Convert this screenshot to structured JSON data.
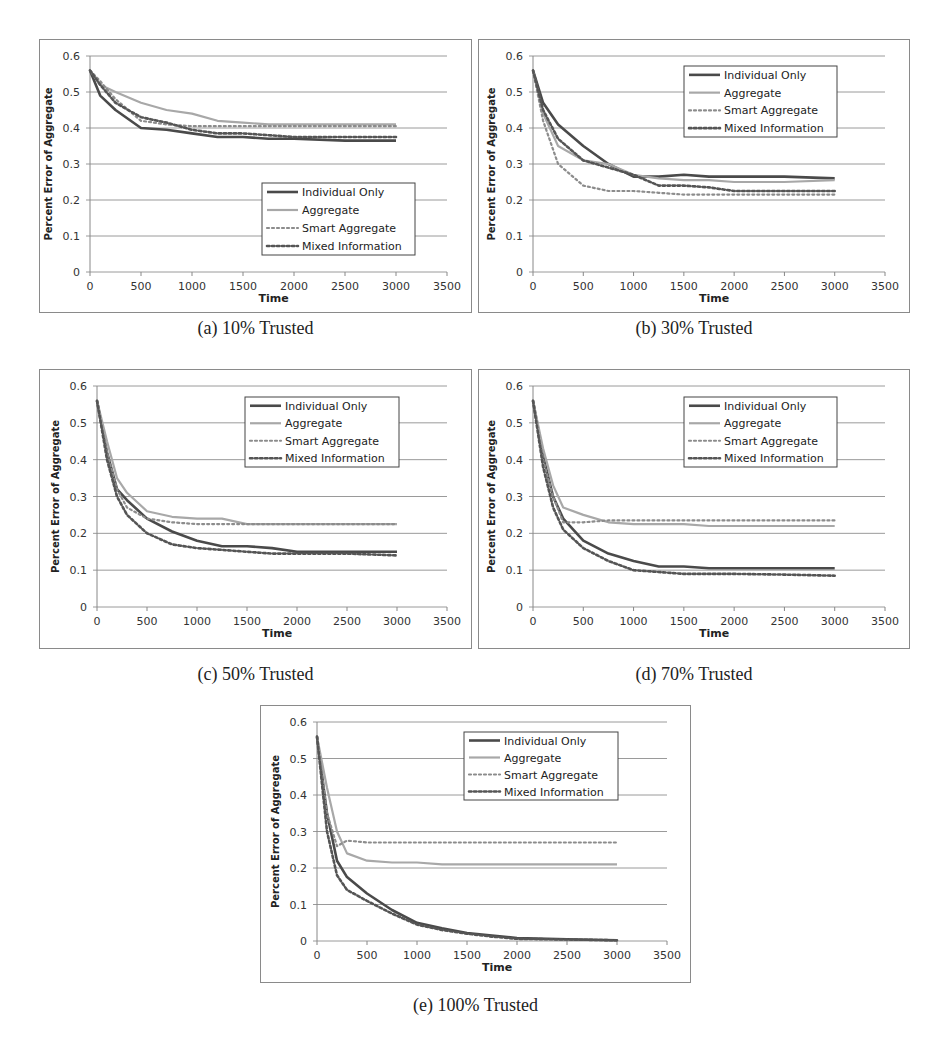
{
  "figure": {
    "captions": [
      "(a) 10% Trusted",
      "(b) 30% Trusted",
      "(c) 50% Trusted",
      "(d) 70% Trusted",
      "(e) 100% Trusted"
    ]
  },
  "colors": {
    "individual_only": "#4a4a4a",
    "aggregate": "#a8a8a8",
    "smart_aggregate": "#8c8c8c",
    "mixed_information": "#555555",
    "gridline": "#9a9a9a",
    "frame": "#8a8a8a"
  },
  "chart_data": [
    {
      "type": "line",
      "title": "(a) 10% Trusted",
      "xlabel": "Time",
      "ylabel": "Percent Error of Aggregate",
      "xlim": [
        0,
        3500
      ],
      "ylim": [
        0,
        0.6
      ],
      "xticks": [
        "0",
        "500",
        "1000",
        "1500",
        "2000",
        "2500",
        "3000",
        "3500"
      ],
      "yticks": [
        "0",
        "0.1",
        "0.2",
        "0.3",
        "0.4",
        "0.5",
        "0.6"
      ],
      "grid": "horizontal",
      "legend": {
        "position": "lower-right",
        "entries": [
          "Individual Only",
          "Aggregate",
          "Smart Aggregate",
          "Mixed Information"
        ]
      },
      "x": [
        0,
        100,
        250,
        500,
        750,
        1000,
        1250,
        1500,
        1750,
        2000,
        2500,
        3000
      ],
      "series": [
        {
          "name": "Individual Only",
          "style": "solid-dark",
          "values": [
            0.56,
            0.49,
            0.45,
            0.4,
            0.395,
            0.385,
            0.375,
            0.375,
            0.37,
            0.37,
            0.365,
            0.365
          ]
        },
        {
          "name": "Aggregate",
          "style": "solid-light",
          "values": [
            0.56,
            0.52,
            0.5,
            0.47,
            0.45,
            0.44,
            0.42,
            0.415,
            0.41,
            0.41,
            0.41,
            0.41
          ]
        },
        {
          "name": "Smart Aggregate",
          "style": "dotted-light",
          "values": [
            0.56,
            0.53,
            0.48,
            0.42,
            0.41,
            0.405,
            0.405,
            0.405,
            0.405,
            0.405,
            0.405,
            0.405
          ]
        },
        {
          "name": "Mixed Information",
          "style": "dotted-dark",
          "values": [
            0.56,
            0.52,
            0.47,
            0.43,
            0.415,
            0.395,
            0.385,
            0.385,
            0.38,
            0.375,
            0.375,
            0.375
          ]
        }
      ]
    },
    {
      "type": "line",
      "title": "(b) 30% Trusted",
      "xlabel": "Time",
      "ylabel": "Percent Error of Aggregate",
      "xlim": [
        0,
        3500
      ],
      "ylim": [
        0,
        0.6
      ],
      "xticks": [
        "0",
        "500",
        "1000",
        "1500",
        "2000",
        "2500",
        "3000",
        "3500"
      ],
      "yticks": [
        "0",
        "0.1",
        "0.2",
        "0.3",
        "0.4",
        "0.5",
        "0.6"
      ],
      "grid": "horizontal",
      "legend": {
        "position": "upper-right",
        "entries": [
          "Individual Only",
          "Aggregate",
          "Smart Aggregate",
          "Mixed Information"
        ]
      },
      "x": [
        0,
        100,
        250,
        500,
        750,
        1000,
        1250,
        1500,
        1750,
        2000,
        2500,
        3000
      ],
      "series": [
        {
          "name": "Individual Only",
          "style": "solid-dark",
          "values": [
            0.56,
            0.47,
            0.41,
            0.35,
            0.3,
            0.265,
            0.265,
            0.27,
            0.265,
            0.265,
            0.265,
            0.26
          ]
        },
        {
          "name": "Aggregate",
          "style": "solid-light",
          "values": [
            0.56,
            0.44,
            0.35,
            0.31,
            0.3,
            0.27,
            0.26,
            0.255,
            0.255,
            0.25,
            0.25,
            0.255
          ]
        },
        {
          "name": "Smart Aggregate",
          "style": "dotted-light",
          "values": [
            0.56,
            0.42,
            0.3,
            0.24,
            0.225,
            0.225,
            0.22,
            0.215,
            0.215,
            0.215,
            0.215,
            0.215
          ]
        },
        {
          "name": "Mixed Information",
          "style": "dotted-dark",
          "values": [
            0.56,
            0.45,
            0.37,
            0.31,
            0.29,
            0.27,
            0.24,
            0.24,
            0.235,
            0.225,
            0.225,
            0.225
          ]
        }
      ]
    },
    {
      "type": "line",
      "title": "(c) 50% Trusted",
      "xlabel": "Time",
      "ylabel": "Percent Error of Aggregate",
      "xlim": [
        0,
        3500
      ],
      "ylim": [
        0,
        0.6
      ],
      "xticks": [
        "0",
        "500",
        "1000",
        "1500",
        "2000",
        "2500",
        "3000",
        "3500"
      ],
      "yticks": [
        "0",
        "0.1",
        "0.2",
        "0.3",
        "0.4",
        "0.5",
        "0.6"
      ],
      "grid": "horizontal",
      "legend": {
        "position": "upper-right",
        "entries": [
          "Individual Only",
          "Aggregate",
          "Smart Aggregate",
          "Mixed Information"
        ]
      },
      "x": [
        0,
        100,
        200,
        300,
        500,
        750,
        1000,
        1250,
        1500,
        1750,
        2000,
        2500,
        3000
      ],
      "series": [
        {
          "name": "Individual Only",
          "style": "solid-dark",
          "values": [
            0.56,
            0.42,
            0.32,
            0.29,
            0.24,
            0.205,
            0.18,
            0.165,
            0.165,
            0.16,
            0.15,
            0.15,
            0.15
          ]
        },
        {
          "name": "Aggregate",
          "style": "solid-light",
          "values": [
            0.56,
            0.45,
            0.35,
            0.31,
            0.26,
            0.245,
            0.24,
            0.24,
            0.225,
            0.225,
            0.225,
            0.225,
            0.225
          ]
        },
        {
          "name": "Smart Aggregate",
          "style": "dotted-light",
          "values": [
            0.56,
            0.42,
            0.32,
            0.27,
            0.24,
            0.23,
            0.225,
            0.225,
            0.225,
            0.225,
            0.225,
            0.225,
            0.225
          ]
        },
        {
          "name": "Mixed Information",
          "style": "dotted-dark",
          "values": [
            0.56,
            0.4,
            0.3,
            0.25,
            0.2,
            0.17,
            0.16,
            0.155,
            0.15,
            0.145,
            0.145,
            0.145,
            0.14
          ]
        }
      ]
    },
    {
      "type": "line",
      "title": "(d) 70% Trusted",
      "xlabel": "Time",
      "ylabel": "Percent Error of Aggregate",
      "xlim": [
        0,
        3500
      ],
      "ylim": [
        0,
        0.6
      ],
      "xticks": [
        "0",
        "500",
        "1000",
        "1500",
        "2000",
        "2500",
        "3000",
        "3500"
      ],
      "yticks": [
        "0",
        "0.1",
        "0.2",
        "0.3",
        "0.4",
        "0.5",
        "0.6"
      ],
      "grid": "horizontal",
      "legend": {
        "position": "upper-right",
        "entries": [
          "Individual Only",
          "Aggregate",
          "Smart Aggregate",
          "Mixed Information"
        ]
      },
      "x": [
        0,
        100,
        200,
        300,
        500,
        750,
        1000,
        1250,
        1500,
        1750,
        2000,
        2500,
        3000
      ],
      "series": [
        {
          "name": "Individual Only",
          "style": "solid-dark",
          "values": [
            0.56,
            0.41,
            0.3,
            0.24,
            0.18,
            0.145,
            0.125,
            0.11,
            0.11,
            0.105,
            0.105,
            0.105,
            0.105
          ]
        },
        {
          "name": "Aggregate",
          "style": "solid-light",
          "values": [
            0.56,
            0.43,
            0.33,
            0.27,
            0.25,
            0.23,
            0.225,
            0.225,
            0.225,
            0.22,
            0.22,
            0.22,
            0.22
          ]
        },
        {
          "name": "Smart Aggregate",
          "style": "dotted-light",
          "values": [
            0.56,
            0.4,
            0.3,
            0.23,
            0.23,
            0.235,
            0.235,
            0.235,
            0.235,
            0.235,
            0.235,
            0.235,
            0.235
          ]
        },
        {
          "name": "Mixed Information",
          "style": "dotted-dark",
          "values": [
            0.56,
            0.38,
            0.27,
            0.21,
            0.16,
            0.125,
            0.1,
            0.095,
            0.09,
            0.09,
            0.09,
            0.088,
            0.085
          ]
        }
      ]
    },
    {
      "type": "line",
      "title": "(e) 100% Trusted",
      "xlabel": "Time",
      "ylabel": "Percent Error of Aggregate",
      "xlim": [
        0,
        3500
      ],
      "ylim": [
        0,
        0.6
      ],
      "xticks": [
        "0",
        "500",
        "1000",
        "1500",
        "2000",
        "2500",
        "3000",
        "3500"
      ],
      "yticks": [
        "0",
        "0.1",
        "0.2",
        "0.3",
        "0.4",
        "0.5",
        "0.6"
      ],
      "grid": "horizontal",
      "legend": {
        "position": "upper-right",
        "entries": [
          "Individual Only",
          "Aggregate",
          "Smart Aggregate",
          "Mixed Information"
        ]
      },
      "x": [
        0,
        100,
        200,
        300,
        500,
        750,
        1000,
        1250,
        1500,
        1750,
        2000,
        2500,
        3000
      ],
      "series": [
        {
          "name": "Individual Only",
          "style": "solid-dark",
          "values": [
            0.56,
            0.35,
            0.22,
            0.175,
            0.13,
            0.085,
            0.05,
            0.035,
            0.022,
            0.015,
            0.008,
            0.005,
            0.002
          ]
        },
        {
          "name": "Aggregate",
          "style": "solid-light",
          "values": [
            0.56,
            0.42,
            0.3,
            0.24,
            0.22,
            0.215,
            0.215,
            0.21,
            0.21,
            0.21,
            0.21,
            0.21,
            0.21
          ]
        },
        {
          "name": "Smart Aggregate",
          "style": "dotted-light",
          "values": [
            0.56,
            0.35,
            0.26,
            0.275,
            0.27,
            0.27,
            0.27,
            0.27,
            0.27,
            0.27,
            0.27,
            0.27,
            0.27
          ]
        },
        {
          "name": "Mixed Information",
          "style": "dotted-dark",
          "values": [
            0.56,
            0.3,
            0.18,
            0.14,
            0.11,
            0.075,
            0.045,
            0.03,
            0.02,
            0.012,
            0.006,
            0.004,
            0.002
          ]
        }
      ]
    }
  ]
}
